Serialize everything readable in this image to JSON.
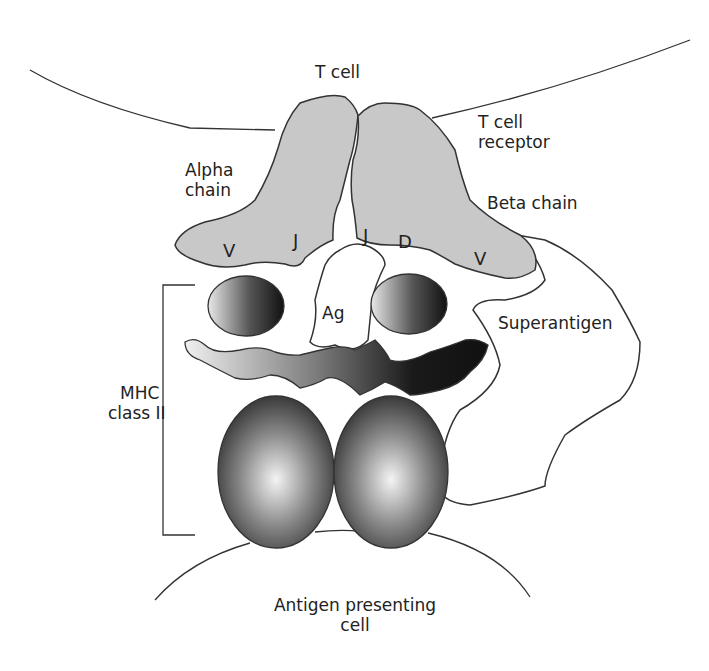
{
  "diagram": {
    "labels": {
      "t_cell": "T cell",
      "t_cell_receptor_line1": "T cell",
      "t_cell_receptor_line2": "receptor",
      "alpha_chain_line1": "Alpha",
      "alpha_chain_line2": "chain",
      "beta_chain": "Beta chain",
      "antigen": "Ag",
      "superantigen": "Superantigen",
      "mhc_line1": "MHC",
      "mhc_line2": "class II",
      "apc_line1": "Antigen presenting",
      "apc_line2": "cell"
    },
    "segments": {
      "alpha_v": "V",
      "alpha_j": "J",
      "beta_j": "J",
      "beta_d": "D",
      "beta_v": "V"
    },
    "colors": {
      "receptor_fill": "#c8c8c8",
      "outline": "#333333",
      "mhc_dark": "#1e1e1e",
      "mhc_light": "#f2f2f2"
    }
  }
}
